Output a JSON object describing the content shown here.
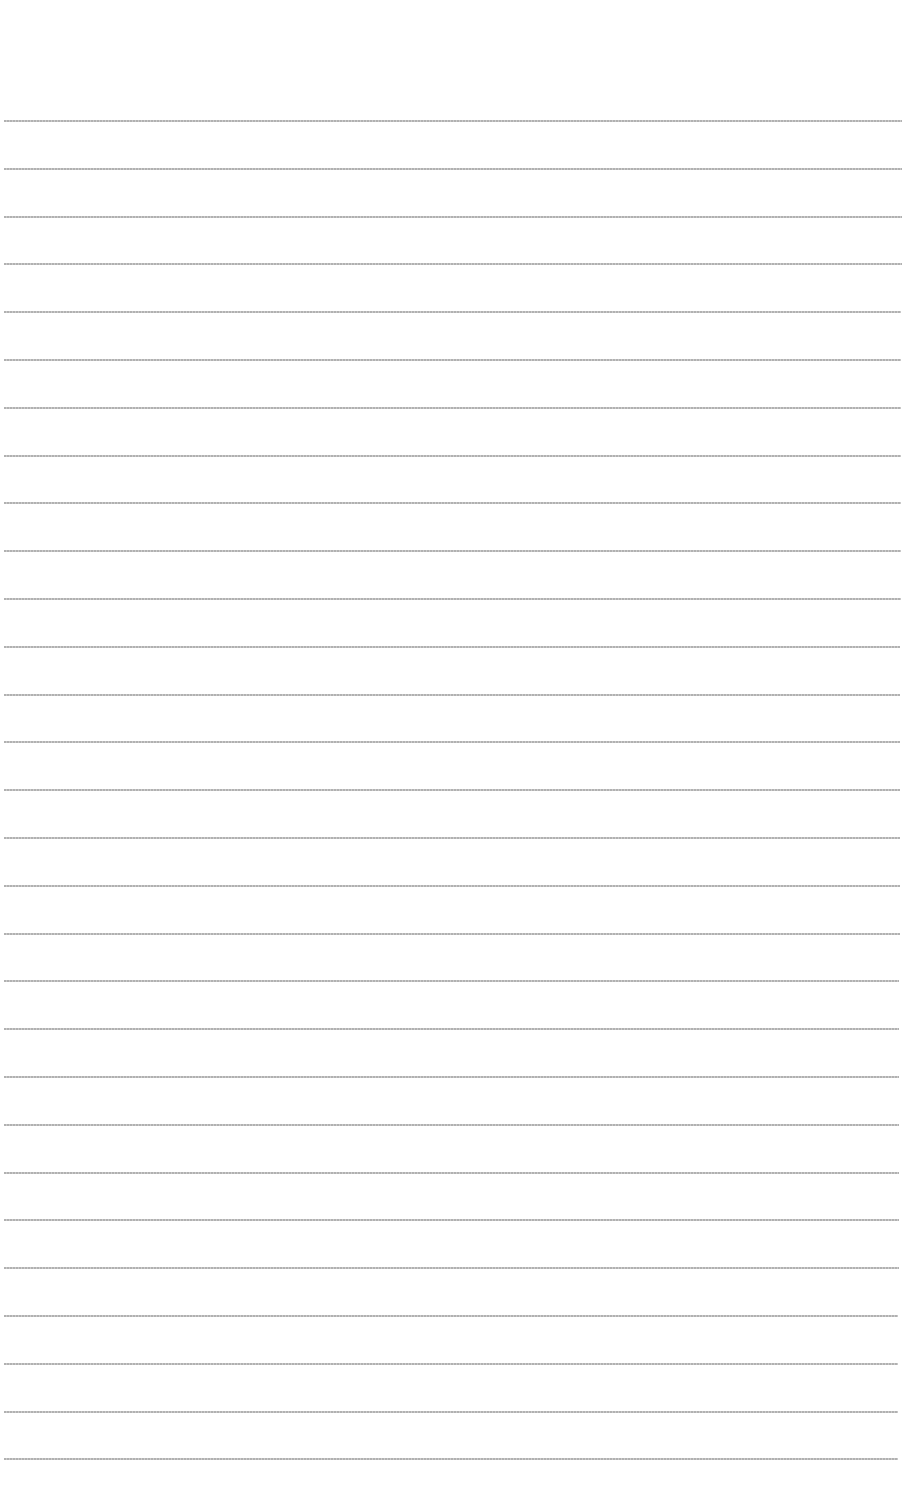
{
  "document": {
    "type": "ruled-paper",
    "background_color": "#ffffff",
    "rule_color": "#b0b0b0",
    "rule_count": 29,
    "first_rule_y": 120,
    "rule_spacing": 47.8,
    "rule_left": 4,
    "rule_right_top": 902,
    "rule_right_bottom": 898
  }
}
